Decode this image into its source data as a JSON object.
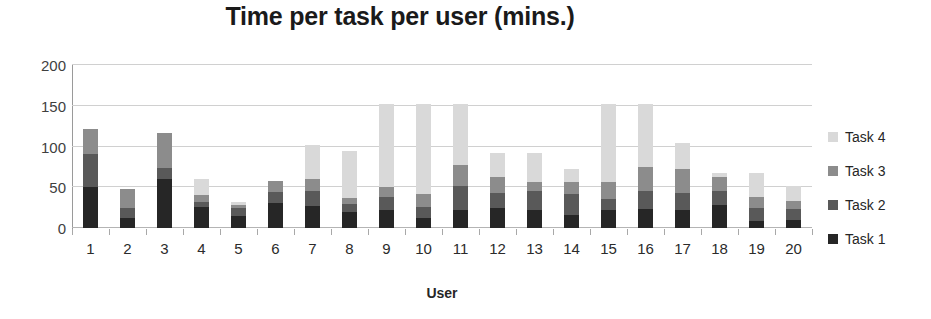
{
  "chart_data": {
    "type": "bar",
    "subtype": "stacked-bar",
    "title": "Time per task per user (mins.)",
    "xlabel": "User",
    "ylabel": "",
    "ylim": [
      0,
      200
    ],
    "yticks": [
      0,
      50,
      100,
      150,
      200
    ],
    "ytick_labels": [
      "0",
      "50",
      "100",
      "150",
      "200"
    ],
    "grid": true,
    "grid_axis": "y",
    "legend_position": "right",
    "categories": [
      "1",
      "2",
      "3",
      "4",
      "5",
      "6",
      "7",
      "8",
      "9",
      "10",
      "11",
      "12",
      "13",
      "14",
      "15",
      "16",
      "17",
      "18",
      "19",
      "20"
    ],
    "series": [
      {
        "name": "Task 1",
        "color": "#262626",
        "values": [
          50,
          12,
          60,
          26,
          15,
          31,
          27,
          20,
          22,
          12,
          22,
          25,
          22,
          16,
          22,
          23,
          22,
          28,
          9,
          10
        ]
      },
      {
        "name": "Task 2",
        "color": "#595959",
        "values": [
          41,
          12,
          14,
          6,
          9,
          13,
          18,
          9,
          16,
          14,
          30,
          18,
          24,
          26,
          13,
          22,
          21,
          18,
          15,
          13
        ]
      },
      {
        "name": "Task 3",
        "color": "#8c8c8c",
        "values": [
          31,
          24,
          42,
          8,
          4,
          14,
          15,
          8,
          12,
          16,
          25,
          20,
          10,
          15,
          22,
          30,
          30,
          17,
          14,
          10
        ]
      },
      {
        "name": "Task 4",
        "color": "#d9d9d9",
        "values": [
          0,
          0,
          0,
          20,
          4,
          0,
          42,
          58,
          102,
          110,
          75,
          29,
          36,
          15,
          95,
          77,
          31,
          4,
          30,
          19
        ]
      }
    ],
    "totals": [
      122,
      48,
      116,
      60,
      32,
      58,
      102,
      95,
      152,
      152,
      152,
      92,
      92,
      72,
      152,
      152,
      104,
      67,
      68,
      52
    ]
  },
  "legend": {
    "items": [
      {
        "label": "Task 4",
        "color": "#d9d9d9"
      },
      {
        "label": "Task 3",
        "color": "#8c8c8c"
      },
      {
        "label": "Task 2",
        "color": "#595959"
      },
      {
        "label": "Task 1",
        "color": "#262626"
      }
    ]
  }
}
